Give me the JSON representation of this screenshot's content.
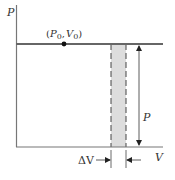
{
  "diagram": {
    "type": "pressure-volume graph",
    "axes": {
      "y_label": "P",
      "x_label": "V"
    },
    "point": {
      "label_p": "P",
      "label_p_sub": "0",
      "label_v": "V",
      "label_v_sub": "0",
      "open": "(",
      "comma": ",",
      "close": ")"
    },
    "height_label": "P",
    "width_label": "ΔV",
    "colors": {
      "axis": "#777777",
      "line": "#666666",
      "shade": "#dddddd",
      "dash": "#444444",
      "arrow": "#333333",
      "dot": "#111111"
    }
  }
}
